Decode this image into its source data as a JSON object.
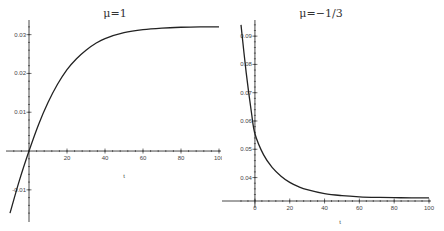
{
  "chart_data": [
    {
      "type": "line",
      "title": "μ=1",
      "xlabel": "t",
      "ylabel": "",
      "xlim": [
        -10,
        100
      ],
      "ylim": [
        -0.017,
        0.033
      ],
      "xticks": [
        20,
        40,
        60,
        80,
        100
      ],
      "xtick_labels": [
        "20",
        "40",
        "60",
        "80",
        "100"
      ],
      "yticks": [
        -0.01,
        0.01,
        0.02,
        0.03
      ],
      "ytick_labels": [
        "-0.01",
        "0.01",
        "0.02",
        "0.03"
      ],
      "grid": false,
      "legend": null,
      "series": [
        {
          "name": "μ=1",
          "x": [
            -10,
            -5,
            0,
            5,
            10,
            15,
            20,
            25,
            30,
            35,
            40,
            50,
            60,
            70,
            80,
            90,
            100
          ],
          "y": [
            -0.016,
            -0.0075,
            0.0,
            0.0068,
            0.0125,
            0.0172,
            0.021,
            0.0238,
            0.026,
            0.0277,
            0.029,
            0.0305,
            0.0313,
            0.0317,
            0.0319,
            0.032,
            0.032
          ]
        }
      ]
    },
    {
      "type": "line",
      "title": "μ=−1/3",
      "xlabel": "t",
      "ylabel": "",
      "xlim": [
        -8,
        100
      ],
      "ylim": [
        0.031,
        0.095
      ],
      "xticks": [
        0,
        20,
        40,
        60,
        80,
        100
      ],
      "xtick_labels": [
        "0",
        "20",
        "40",
        "60",
        "80",
        "100"
      ],
      "yticks": [
        0.04,
        0.05,
        0.06,
        0.07,
        0.08,
        0.09
      ],
      "ytick_labels": [
        "0.04",
        "0.05",
        "0.06",
        "0.07",
        "0.08",
        "0.09"
      ],
      "grid": false,
      "legend": null,
      "series": [
        {
          "name": "μ=−1/3",
          "x": [
            -8,
            -5,
            -2,
            0,
            5,
            10,
            15,
            20,
            25,
            30,
            40,
            50,
            60,
            70,
            80,
            90,
            100
          ],
          "y": [
            0.094,
            0.077,
            0.063,
            0.0555,
            0.048,
            0.0435,
            0.0405,
            0.0383,
            0.0368,
            0.0357,
            0.0343,
            0.0336,
            0.0332,
            0.033,
            0.0329,
            0.0328,
            0.0328
          ]
        }
      ]
    }
  ],
  "plots": [
    {
      "title": "μ=1",
      "xlabel": "t"
    },
    {
      "title": "μ=−1/3",
      "xlabel": "t"
    }
  ]
}
